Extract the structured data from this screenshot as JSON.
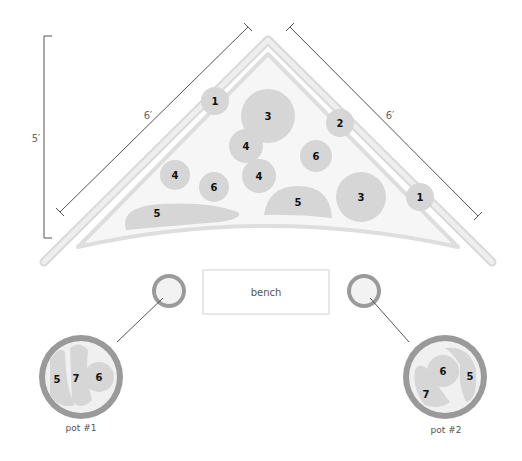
{
  "dimensions": {
    "height_label": "5′",
    "left_side_label": "6′",
    "right_side_label": "6′"
  },
  "bed": {
    "plants": [
      {
        "id": "1",
        "x": 215,
        "y": 101,
        "r": 14
      },
      {
        "id": "3",
        "x": 268,
        "y": 116,
        "r": 27
      },
      {
        "id": "2",
        "x": 340,
        "y": 123,
        "r": 14
      },
      {
        "id": "4",
        "x": 246,
        "y": 146,
        "r": 17
      },
      {
        "id": "6",
        "x": 316,
        "y": 156,
        "r": 16
      },
      {
        "id": "4",
        "x": 175,
        "y": 175,
        "r": 15
      },
      {
        "id": "4",
        "x": 259,
        "y": 176,
        "r": 17
      },
      {
        "id": "6",
        "x": 214,
        "y": 187,
        "r": 15
      },
      {
        "id": "3",
        "x": 361,
        "y": 197,
        "r": 25
      },
      {
        "id": "1",
        "x": 420,
        "y": 197,
        "r": 14
      }
    ],
    "blobs": [
      {
        "id": "5",
        "label_x": 157,
        "label_y": 213
      },
      {
        "id": "5",
        "label_x": 298,
        "label_y": 202
      }
    ]
  },
  "bench": {
    "label": "bench"
  },
  "pots": [
    {
      "label": "pot #1",
      "plants": [
        "5",
        "7",
        "6"
      ]
    },
    {
      "label": "pot #2",
      "plants": [
        "6",
        "5",
        "7"
      ]
    }
  ],
  "colors": {
    "plant_fill": "#d6d6d6",
    "bed_fill": "#f6f6f6",
    "border": "#e1e1e1",
    "pot_rim": "#9a9a9a"
  }
}
